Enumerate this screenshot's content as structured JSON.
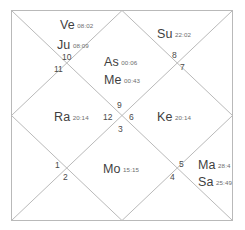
{
  "chart": {
    "style": "north-indian-diamond",
    "kind": "vedic-birth-chart",
    "line_color": "#b9b9b9",
    "text_color": "#4a4a4a",
    "degree_color": "#6d6d6d",
    "background": "#ffffff"
  },
  "planets": [
    {
      "id": "venus",
      "abbr": "Ve",
      "degree": "08:02",
      "house": 10
    },
    {
      "id": "jupiter",
      "abbr": "Ju",
      "degree": "08:09",
      "house": 10
    },
    {
      "id": "ascendant",
      "abbr": "As",
      "degree": "00:06",
      "house": 1
    },
    {
      "id": "mercury",
      "abbr": "Me",
      "degree": "00:43",
      "house": 1
    },
    {
      "id": "sun",
      "abbr": "Su",
      "degree": "22:02",
      "house": 8
    },
    {
      "id": "rahu",
      "abbr": "Ra",
      "degree": "20:14",
      "house": 12
    },
    {
      "id": "ketu",
      "abbr": "Ke",
      "degree": "20:14",
      "house": 6
    },
    {
      "id": "moon",
      "abbr": "Mo",
      "degree": "15:15",
      "house": 3
    },
    {
      "id": "mars",
      "abbr": "Ma",
      "degree": "28:4",
      "house": 5
    },
    {
      "id": "saturn",
      "abbr": "Sa",
      "degree": "25:49",
      "house": 5
    }
  ],
  "house_numbers": {
    "center_top": "9",
    "center_left": "12",
    "center_right": "6",
    "center_bottom": "3",
    "upper_left_outer": "10",
    "upper_left_inner": "11",
    "upper_right_outer": "8",
    "upper_right_inner": "7",
    "lower_left_outer": "1",
    "lower_left_inner": "2",
    "lower_right_outer": "5",
    "lower_right_inner": "4"
  }
}
